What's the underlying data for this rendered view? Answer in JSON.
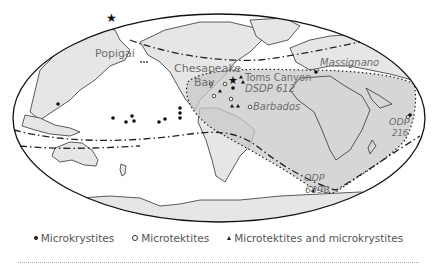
{
  "map": {
    "projection": "Mollweide world map",
    "colors": {
      "ocean": "#ffffff",
      "land": "#e6e6e6",
      "strewn_field": "#c8c8c8",
      "outline": "#1a1a1a",
      "label": "#6e6e6e"
    },
    "place_labels": [
      {
        "id": "popigai",
        "text": "Popigai",
        "style": "normal"
      },
      {
        "id": "chesapeake",
        "text": "Chesapeake",
        "style": "normal"
      },
      {
        "id": "bay",
        "text": "Bay",
        "style": "normal"
      },
      {
        "id": "toms-canyon",
        "text": "Toms Canyon",
        "style": "normal"
      },
      {
        "id": "dsdp612",
        "text": "DSDP 612",
        "style": "italic"
      },
      {
        "id": "barbados",
        "text": "Barbados",
        "style": "italic"
      },
      {
        "id": "massignano",
        "text": "Massignano",
        "style": "italic"
      },
      {
        "id": "odp216-a",
        "text": "ODP",
        "style": "italic"
      },
      {
        "id": "odp216-b",
        "text": "216",
        "style": "italic"
      },
      {
        "id": "odp689b-a",
        "text": "ODP",
        "style": "italic"
      },
      {
        "id": "odp689b-b",
        "text": "689B",
        "style": "italic"
      }
    ]
  },
  "legend": {
    "items": [
      {
        "symbol": "filled-circle",
        "label": "Microkrystites"
      },
      {
        "symbol": "open-circle",
        "label": "Microtektites"
      },
      {
        "symbol": "filled-triangle",
        "label": "Microtektites and microkrystites"
      }
    ]
  }
}
